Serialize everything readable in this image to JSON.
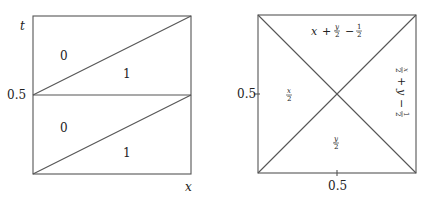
{
  "left_panel": {
    "axis_labels": {
      "vertical": "t",
      "horizontal": "x"
    },
    "tick_labels": {
      "t_mid": "0.5"
    },
    "regions": {
      "upper_left": "0",
      "upper_right": "1",
      "lower_left": "0",
      "lower_right": "1"
    }
  },
  "right_panel": {
    "tick_labels": {
      "y_mid": "0.5",
      "x_mid": "0.5"
    },
    "regions": {
      "top": {
        "a": "x",
        "plus": "+",
        "num1": "y",
        "den1": "2",
        "minus": "−",
        "num2": "1",
        "den2": "2"
      },
      "left": {
        "num": "x",
        "den": "2"
      },
      "bottom": {
        "num": "y",
        "den": "2"
      },
      "right": {
        "num1": "x",
        "den1": "2",
        "plus": "+",
        "b": "y",
        "minus": "−",
        "num2": "1",
        "den2": "2"
      }
    }
  }
}
